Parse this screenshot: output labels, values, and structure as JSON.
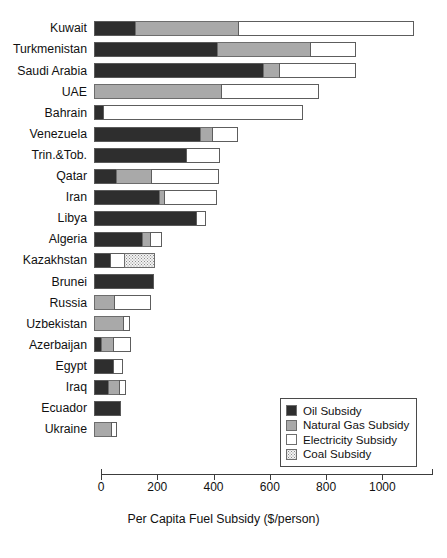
{
  "chart_data": {
    "type": "bar",
    "orientation": "horizontal",
    "stacked": true,
    "title": "",
    "xlabel": "Per Capita Fuel Subsidy ($/person)",
    "ylabel": "",
    "xlim": [
      0,
      1180
    ],
    "xticks": [
      0,
      200,
      400,
      600,
      800,
      1000
    ],
    "xtick_labels": [
      "0",
      "200",
      "400",
      "600",
      "800",
      "1000"
    ],
    "grid": false,
    "legend_position": "lower-right",
    "categories": [
      "Kuwait",
      "Turkmenistan",
      "Saudi Arabia",
      "UAE",
      "Bahrain",
      "Venezuela",
      "Trin.&Tob.",
      "Qatar",
      "Iran",
      "Libya",
      "Algeria",
      "Kazakhstan",
      "Brunei",
      "Russia",
      "Uzbekistan",
      "Azerbaijan",
      "Egypt",
      "Iraq",
      "Ecuador",
      "Ukraine"
    ],
    "series": [
      {
        "name": "Oil Subsidy",
        "key": "oil",
        "color": "#2e2e2e",
        "values": [
          150,
          440,
          605,
          0,
          35,
          380,
          330,
          80,
          235,
          365,
          175,
          60,
          215,
          0,
          0,
          30,
          70,
          55,
          95,
          0
        ]
      },
      {
        "name": "Natural Gas Subsidy",
        "key": "natural_gas",
        "color": "#a9a9a9",
        "values": [
          370,
          335,
          60,
          455,
          0,
          45,
          0,
          130,
          20,
          0,
          30,
          0,
          0,
          75,
          105,
          45,
          0,
          40,
          0,
          65
        ]
      },
      {
        "name": "Electricity Subsidy",
        "key": "electricity",
        "color": "#ffffff",
        "values": [
          625,
          165,
          275,
          350,
          710,
          95,
          120,
          240,
          190,
          35,
          45,
          55,
          0,
          130,
          25,
          65,
          35,
          25,
          0,
          20
        ]
      },
      {
        "name": "Coal Subsidy",
        "key": "coal",
        "color": "#f2f2f2",
        "values": [
          0,
          0,
          0,
          0,
          0,
          0,
          0,
          0,
          0,
          0,
          0,
          110,
          0,
          0,
          0,
          0,
          0,
          0,
          0,
          0
        ]
      }
    ],
    "totals": [
      1145,
      940,
      940,
      805,
      745,
      520,
      450,
      450,
      445,
      400,
      250,
      225,
      215,
      205,
      130,
      140,
      105,
      120,
      95,
      85
    ]
  },
  "legend": {
    "items": [
      {
        "label": "Oil Subsidy",
        "key": "oil"
      },
      {
        "label": "Natural Gas Subsidy",
        "key": "natural_gas"
      },
      {
        "label": "Electricity Subsidy",
        "key": "electricity"
      },
      {
        "label": "Coal Subsidy",
        "key": "coal"
      }
    ]
  }
}
